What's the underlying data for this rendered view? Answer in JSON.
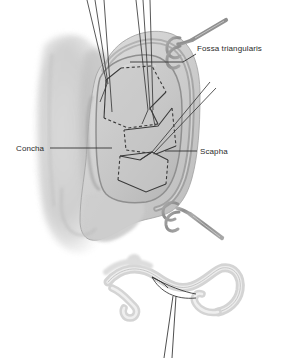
{
  "figure": {
    "view": "lateral view of auricle with retractors and sutures",
    "background_color": "#ffffff",
    "line_color": "#3a3a3a",
    "cartilage_fill": "#c8c8c8",
    "skin_fill": "#d2d2d2",
    "shadow_fill": "#b4b4b4",
    "instrument_color": "#9a9a9a",
    "text_color": "#2b2b2b"
  },
  "labels": [
    {
      "id": "fossa-triangularis",
      "text": "Fossa triangularis",
      "x": 197,
      "y": 51,
      "anchor": "start",
      "leader": "M 196 54 L 183 62 L 160 62 L 130 62"
    },
    {
      "id": "concha",
      "text": "Concha",
      "x": 16,
      "y": 151,
      "anchor": "start",
      "leader": "M 50 148 L 112 148"
    },
    {
      "id": "scapha",
      "text": "Scapha",
      "x": 200,
      "y": 154,
      "anchor": "start",
      "leader": "M 197 151 L 165 151"
    }
  ],
  "instruments": [
    {
      "id": "skin-hook-upper",
      "type": "double-prong-skin-hook",
      "x": 170,
      "y": 38
    },
    {
      "id": "skin-hook-lower",
      "type": "double-prong-skin-hook",
      "x": 168,
      "y": 205
    }
  ],
  "suture_groups": [
    {
      "id": "suture-pair-upper-left",
      "threads": 3,
      "converge_x": 105,
      "converge_y": 82
    },
    {
      "id": "suture-pair-upper-right",
      "threads": 3,
      "converge_x": 145,
      "converge_y": 110
    },
    {
      "id": "suture-pair-lower-right",
      "threads": 2,
      "converge_x": 152,
      "converge_y": 152
    }
  ],
  "inset": {
    "id": "cross-section-inset",
    "caption": "",
    "description": "cross-sectional profile of folded cartilage with suture loop",
    "x": 105,
    "y": 255,
    "width": 165,
    "height": 100,
    "suture_threads": 2
  },
  "flaps": [
    {
      "id": "flap-upper",
      "edge_style": "solid-and-dashed"
    },
    {
      "id": "flap-middle",
      "edge_style": "solid-and-dashed"
    },
    {
      "id": "flap-lower",
      "edge_style": "solid-and-dashed"
    }
  ]
}
